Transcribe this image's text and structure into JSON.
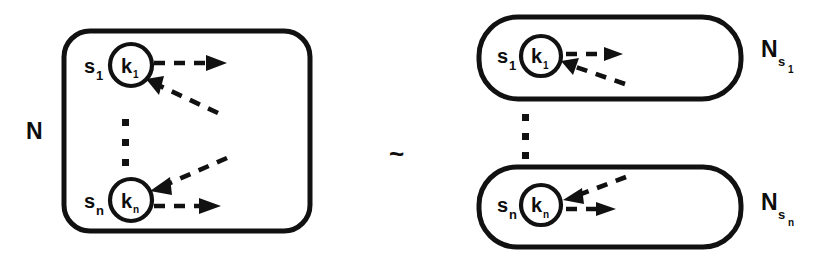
{
  "figure": {
    "relation_symbol": "~",
    "stroke_color": "#111111",
    "background_color": "#ffffff"
  },
  "left": {
    "container_label": "N",
    "vertical_ellipsis": "⋮",
    "nodes": [
      {
        "state_label": "s",
        "state_sub": "1",
        "kernel_label": "k",
        "kernel_sub": "1",
        "outgoing_arrow": "dashed-arrow-right",
        "incoming_arrow": "dashed-arrow-in-from-lower-right"
      },
      {
        "state_label": "s",
        "state_sub": "n",
        "kernel_label": "k",
        "kernel_sub": "n",
        "outgoing_arrow": "dashed-arrow-right",
        "incoming_arrow": "dashed-arrow-in-from-upper-right"
      }
    ]
  },
  "right": {
    "vertical_ellipsis": "⋮",
    "boxes": [
      {
        "container_label": "N",
        "container_sub": "s",
        "container_sub_sub": "1",
        "state_label": "s",
        "state_sub": "1",
        "kernel_label": "k",
        "kernel_sub": "1",
        "outgoing_arrow": "dashed-arrow-right",
        "incoming_arrow": "dashed-arrow-in-from-lower-right"
      },
      {
        "container_label": "N",
        "container_sub": "s",
        "container_sub_sub": "n",
        "state_label": "s",
        "state_sub": "n",
        "kernel_label": "k",
        "kernel_sub": "n",
        "outgoing_arrow": "dashed-arrow-right",
        "incoming_arrow": "dashed-arrow-in-from-upper-right"
      }
    ]
  }
}
